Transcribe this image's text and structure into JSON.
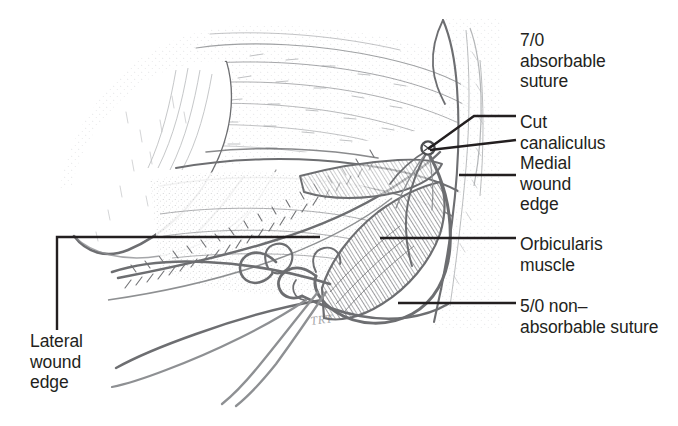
{
  "figure": {
    "background_color": "#ffffff",
    "ink_color": "#6d6e71",
    "leader_color": "#231f20",
    "text_color": "#231f20",
    "width": 678,
    "height": 426,
    "artist_signature": "TRT"
  },
  "labels": {
    "absorbable_suture": "7/0\nabsorbable\nsuture",
    "cut_canaliculus": "Cut\ncanaliculus",
    "medial_wound_edge": "Medial\nwound\nedge",
    "orbicularis_muscle": "Orbicularis\nmuscle",
    "nonabsorbable_suture": "5/0 non–\nabsorbable suture",
    "lateral_wound_edge": "Lateral\nwound\nedge"
  },
  "callouts": [
    {
      "name": "absorbable-suture",
      "text": "7/0 absorbable suture",
      "side": "right"
    },
    {
      "name": "cut-canaliculus",
      "text": "Cut canaliculus",
      "side": "right"
    },
    {
      "name": "medial-wound-edge",
      "text": "Medial wound edge",
      "side": "right"
    },
    {
      "name": "orbicularis-muscle",
      "text": "Orbicularis muscle",
      "side": "right"
    },
    {
      "name": "nonabsorbable-suture",
      "text": "5/0 non–absorbable suture",
      "side": "right"
    },
    {
      "name": "lateral-wound-edge",
      "text": "Lateral wound edge",
      "side": "left"
    }
  ]
}
